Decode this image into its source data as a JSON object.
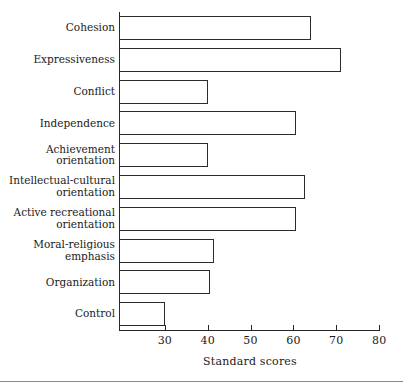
{
  "chart_data": {
    "type": "bar",
    "orientation": "horizontal",
    "title": "",
    "xlabel": "Standard scores",
    "ylabel": "",
    "xlim": [
      19.3,
      80.2
    ],
    "xticks": [
      30,
      40,
      50,
      60,
      70,
      80
    ],
    "xtick_labels": [
      "30",
      "40",
      "50",
      "60",
      "70",
      "80"
    ],
    "grid": false,
    "legend": false,
    "bar_facecolor": "#ffffff",
    "bar_edgecolor": "#2b2b2b",
    "categories": [
      "Cohesion",
      "Expressiveness",
      "Conflict",
      "Independence",
      "Achievement\norientation",
      "Intellectual-cultural\norientation",
      "Active recreational\norientation",
      "Moral-religious\nemphasis",
      "Organization",
      "Control"
    ],
    "values": [
      64,
      71.2,
      40,
      60.7,
      40,
      62.8,
      60.5,
      41.4,
      40.5,
      30
    ]
  },
  "axis": {
    "x_title": "Standard scores"
  }
}
